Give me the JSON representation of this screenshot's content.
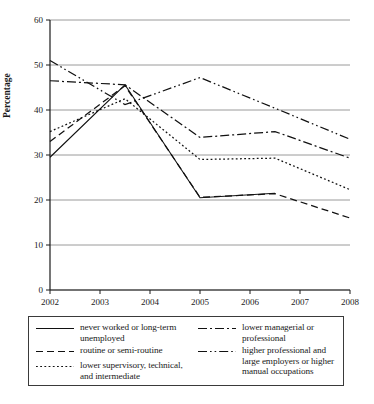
{
  "chart_data": {
    "type": "line",
    "title": "",
    "xlabel": "",
    "ylabel": "Percentage",
    "xlim": [
      2002,
      2008
    ],
    "ylim": [
      0,
      60
    ],
    "ytick_values": [
      0,
      10,
      20,
      30,
      40,
      50,
      60
    ],
    "ytick_labels": [
      "0",
      "10",
      "20",
      "30",
      "40",
      "50",
      "60"
    ],
    "xtick_values": [
      2002,
      2003,
      2004,
      2005,
      2006,
      2007,
      2008
    ],
    "xtick_labels": [
      "2002",
      "2003",
      "2004",
      "2005",
      "2006",
      "2007",
      "2008"
    ],
    "grid": "horizontal",
    "legend_position": "below",
    "series": [
      {
        "name": "never worked or long-term unemployed",
        "style": "solid",
        "x": [
          2002,
          2003.5,
          2005,
          2006.5
        ],
        "values": [
          29.5,
          45.6,
          20.5,
          21.5
        ]
      },
      {
        "name": "routine or semi-routine",
        "style": "dashed",
        "x": [
          2002,
          2003.5,
          2005,
          2006.5,
          2008
        ],
        "values": [
          33.0,
          45.4,
          20.6,
          21.4,
          16.0
        ]
      },
      {
        "name": "lower supervisory, technical, and intermediate",
        "style": "dotted",
        "x": [
          2002,
          2003.5,
          2005,
          2006.5,
          2008
        ],
        "values": [
          35.2,
          42.5,
          29.0,
          29.3,
          22.3
        ]
      },
      {
        "name": "lower managerial or professional",
        "style": "dash-dot",
        "x": [
          2002,
          2003.5,
          2005,
          2006.5,
          2008
        ],
        "values": [
          46.5,
          45.6,
          33.9,
          35.2,
          29.3
        ]
      },
      {
        "name": "higher professional and large employers or higher manual occupations",
        "style": "dash-dot-dot",
        "x": [
          2002,
          2003.5,
          2005,
          2006.5,
          2008
        ],
        "values": [
          51.0,
          41.2,
          47.2,
          40.4,
          33.5
        ]
      }
    ]
  },
  "axis": {
    "ylabel": "Percentage"
  },
  "legend": {
    "left_column": [
      {
        "label": "never worked or long-term unemployed",
        "style": "solid"
      },
      {
        "label": "routine or semi-routine",
        "style": "dashed"
      },
      {
        "label": "lower supervisory, technical, and intermediate",
        "style": "dotted"
      }
    ],
    "right_column": [
      {
        "label": "lower managerial or professional",
        "style": "dash-dot"
      },
      {
        "label": "higher professional and large employers or higher manual occupations",
        "style": "dash-dot-dot"
      }
    ]
  }
}
